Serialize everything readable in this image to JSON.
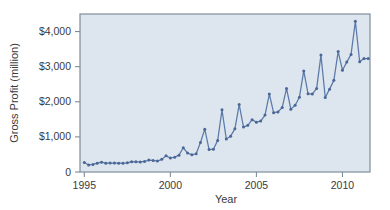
{
  "chart_data": {
    "type": "line",
    "title": "",
    "xlabel": "Year",
    "ylabel": "Gross Profit (million)",
    "xlim": [
      1994.75,
      2011.6
    ],
    "ylim": [
      0,
      4500
    ],
    "xticks": [
      1995,
      2000,
      2005,
      2010
    ],
    "xticklabels": [
      "1995",
      "2000",
      "2005",
      "2010"
    ],
    "yticks": [
      0,
      1000,
      2000,
      3000,
      4000
    ],
    "yticklabels": [
      "0",
      "$1,000",
      "$2,000",
      "$3,000",
      "$4,000"
    ],
    "grid": false,
    "legend": null,
    "marker": "circle",
    "line_color": "#5b7aa8",
    "marker_color": "#4a6795",
    "plot_background": "#dde5ee",
    "frame_color": "#7f8c99",
    "series": [
      {
        "name": "Gross Profit",
        "x": [
          1995.0,
          1995.25,
          1995.5,
          1995.75,
          1996.0,
          1996.25,
          1996.5,
          1996.75,
          1997.0,
          1997.25,
          1997.5,
          1997.75,
          1998.0,
          1998.25,
          1998.5,
          1998.75,
          1999.0,
          1999.25,
          1999.5,
          1999.75,
          2000.0,
          2000.25,
          2000.5,
          2000.75,
          2001.0,
          2001.25,
          2001.5,
          2001.75,
          2002.0,
          2002.25,
          2002.5,
          2002.75,
          2003.0,
          2003.25,
          2003.5,
          2003.75,
          2004.0,
          2004.25,
          2004.5,
          2004.75,
          2005.0,
          2005.25,
          2005.5,
          2005.75,
          2006.0,
          2006.25,
          2006.5,
          2006.75,
          2007.0,
          2007.25,
          2007.5,
          2007.75,
          2008.0,
          2008.25,
          2008.5,
          2008.75,
          2009.0,
          2009.25,
          2009.5,
          2009.75,
          2010.0,
          2010.25,
          2010.5,
          2010.75,
          2011.0,
          2011.25
        ],
        "values": [
          270,
          200,
          215,
          250,
          280,
          250,
          255,
          255,
          250,
          250,
          260,
          295,
          290,
          285,
          300,
          340,
          330,
          310,
          360,
          460,
          400,
          420,
          480,
          690,
          540,
          490,
          520,
          840,
          1220,
          640,
          650,
          900,
          1770,
          940,
          1020,
          1230,
          1920,
          1280,
          1330,
          1490,
          1420,
          1450,
          1620,
          2220,
          1690,
          1710,
          1840,
          2380,
          1790,
          1900,
          2130,
          2880,
          2230,
          2220,
          2380,
          3330,
          2120,
          2360,
          2610,
          3430,
          2390,
          2750,
          3200,
          3950,
          2900,
          3130
        ]
      }
    ]
  },
  "extra_points": {
    "x": [
      2010.0,
      2010.25,
      2010.5,
      2010.75,
      2011.0,
      2011.25,
      2011.5
    ],
    "values": [
      2900,
      3130,
      3350,
      4290,
      3140,
      3230,
      3230
    ]
  }
}
